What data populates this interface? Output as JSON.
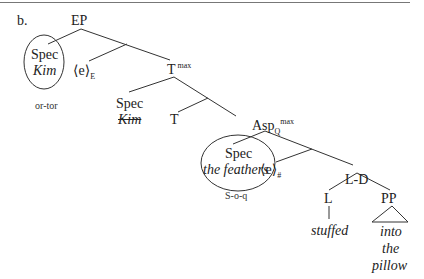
{
  "example_label": "b.",
  "nodes": {
    "ep": "EP",
    "spec1_label": "Spec",
    "spec1_word": "Kim",
    "e_E_base": "⟨e⟩",
    "e_E_sub": "E",
    "tmax_base": "T",
    "tmax_sup": "max",
    "spec2_label": "Spec",
    "spec2_word": "Kim",
    "t": "T",
    "asp_base": "Asp",
    "asp_sub": "Q",
    "asp_sup": "max",
    "spec3_label": "Spec",
    "spec3_word": "the feathers",
    "e_hash_base": "⟨e⟩",
    "e_hash_sub": "#",
    "ld": "L-D",
    "l": "L",
    "pp": "PP",
    "stuffed": "stuffed",
    "pp_words": [
      "into",
      "the",
      "pillow"
    ]
  },
  "annotations": {
    "spec1_note": "or-tor",
    "spec3_note": "S-o-q"
  },
  "colors": {
    "line": "#333333",
    "text": "#222222"
  }
}
